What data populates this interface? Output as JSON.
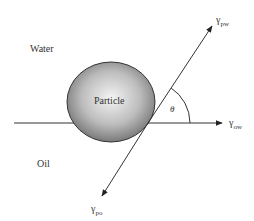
{
  "diagram": {
    "phases": {
      "upper": "Water",
      "lower": "Oil"
    },
    "particle_label": "Particle",
    "angle_label": "θ",
    "vectors": [
      {
        "id": "pw",
        "symbol": "γ",
        "subscript": "pw",
        "direction": "up-right"
      },
      {
        "id": "ow",
        "symbol": "γ",
        "subscript": "ow",
        "direction": "right"
      },
      {
        "id": "po",
        "symbol": "γ",
        "subscript": "po",
        "direction": "down-left"
      }
    ],
    "colors": {
      "line": "#333333",
      "particle_light": "#f2f2f2",
      "particle_dark": "#6e6e6e",
      "text": "#333333"
    }
  }
}
